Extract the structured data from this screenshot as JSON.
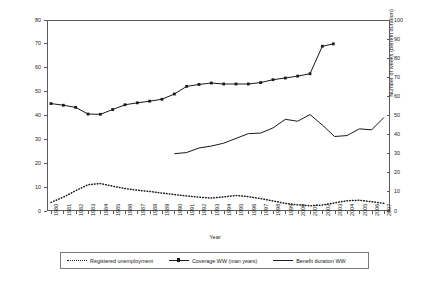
{
  "chart_data": {
    "type": "line",
    "title": "",
    "xlabel": "Year",
    "ylabel_left": "% of working-age population (coverage), and % of labour force (unemployment)",
    "ylabel_right": "Number of weeks (benefit duration)",
    "x": [
      1980,
      1981,
      1982,
      1983,
      1984,
      1985,
      1986,
      1987,
      1988,
      1989,
      1990,
      1991,
      1992,
      1993,
      1994,
      1995,
      1996,
      1997,
      1998,
      1999,
      2000,
      2001,
      2002,
      2003,
      2004,
      2005,
      2006,
      2007
    ],
    "xtick_labels": [
      "1980",
      "1981",
      "1982",
      "1983",
      "1984",
      "1985",
      "1986",
      "1987",
      "1988",
      "1989",
      "1990",
      "1991",
      "1992",
      "1993",
      "1994",
      "1995",
      "1996",
      "1997",
      "1998",
      "1999",
      "2000",
      "2001",
      "2002",
      "2003",
      "2004",
      "2005",
      "2006",
      "2007"
    ],
    "ylim_left": [
      0,
      80
    ],
    "ytick_left": [
      0,
      10,
      20,
      30,
      40,
      50,
      60,
      70,
      80
    ],
    "ylim_right": [
      0,
      100
    ],
    "ytick_right": [
      0,
      10,
      20,
      30,
      40,
      50,
      60,
      70,
      80,
      90,
      100
    ],
    "grid": false,
    "legend_position": "bottom",
    "series": [
      {
        "name": "Registered unemployment",
        "axis": "left",
        "style": "dotted",
        "marker": "none",
        "color": "#1a1a1a",
        "x": [
          1980,
          1981,
          1982,
          1983,
          1984,
          1985,
          1986,
          1987,
          1988,
          1989,
          1990,
          1991,
          1992,
          1993,
          1994,
          1995,
          1996,
          1997,
          1998,
          1999,
          2000,
          2001,
          2002,
          2003,
          2004,
          2005,
          2006,
          2007
        ],
        "values": [
          3.6,
          5.8,
          8.5,
          11.0,
          11.5,
          10.4,
          9.4,
          8.7,
          8.2,
          7.5,
          6.9,
          6.3,
          5.8,
          5.4,
          5.9,
          6.5,
          6.0,
          5.2,
          4.2,
          3.2,
          2.6,
          2.2,
          2.5,
          3.4,
          4.3,
          4.5,
          3.9,
          3.2
        ]
      },
      {
        "name": "Coverage WW (man years)",
        "axis": "left",
        "style": "solid",
        "marker": "square",
        "color": "#1a1a1a",
        "x": [
          1980,
          1981,
          1982,
          1983,
          1984,
          1985,
          1986,
          1987,
          1988,
          1989,
          1990,
          1991,
          1992,
          1993,
          1994,
          1995,
          1996,
          1997,
          1998,
          1999,
          2000,
          2001,
          2002
        ],
        "values": [
          45.0,
          44.3,
          43.4,
          40.6,
          40.5,
          42.5,
          44.5,
          45.3,
          46.0,
          46.8,
          49.0,
          52.2,
          53.0,
          53.6,
          53.2,
          53.2,
          53.2,
          53.8,
          55.0,
          55.7,
          56.5,
          57.5,
          69.0
        ]
      },
      {
        "name": "Benefit duration WW",
        "axis": "right",
        "style": "solid",
        "marker": "none",
        "color": "#1a1a1a",
        "x": [
          1990,
          1991,
          1992,
          1993,
          1994,
          1995,
          1996,
          1997,
          1998,
          1999,
          2000,
          2001,
          2002,
          2003,
          2004,
          2005,
          2006,
          2007
        ],
        "values": [
          30.0,
          30.6,
          33.0,
          34.0,
          35.5,
          38.0,
          40.5,
          40.8,
          43.5,
          48.0,
          47.0,
          50.5,
          45.0,
          39.0,
          39.5,
          43.0,
          42.5,
          49.0
        ]
      }
    ],
    "extra_points": {
      "coverage_tail": [
        {
          "x": 2002,
          "y": 70.0
        }
      ]
    }
  },
  "legend": {
    "items": [
      {
        "label": "Registered unemployment",
        "style": "dotted"
      },
      {
        "label": "Coverage WW (man years)",
        "style": "marker"
      },
      {
        "label": "Benefit duration WW",
        "style": "solid"
      }
    ]
  }
}
